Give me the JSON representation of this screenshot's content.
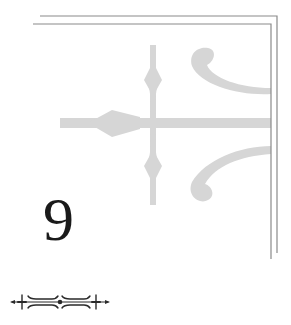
{
  "chapter": {
    "number": "9"
  },
  "decoration": {
    "frame_icon": "double-line-corner-frame",
    "background_icon": "fleur-cross-watermark",
    "divider_icon": "ornamental-divider",
    "colors": {
      "frame": "#8a8a8a",
      "watermark": "#d6d6d6",
      "text": "#1a1a1a",
      "ornament": "#2a2a2a"
    }
  }
}
